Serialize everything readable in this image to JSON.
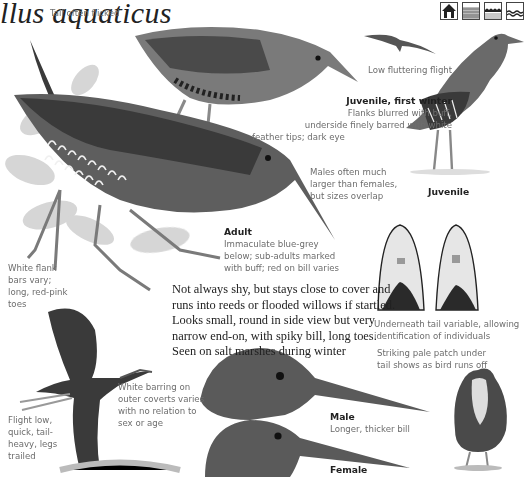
{
  "header": {
    "title": "llus aquaticus",
    "habitat_icons": [
      "reedbed-icon",
      "freshwater-marsh-icon",
      "saltmarsh-icon",
      "coast-water-icon"
    ]
  },
  "captions": {
    "tail": "Tail often flicked",
    "flight_low": "Low fluttering flight",
    "juvenile_first_winter": {
      "heading": "Juvenile, first winter",
      "lines": [
        "Flanks blurred with buff,",
        "underside finely barred with white",
        "feather tips; dark eye"
      ]
    },
    "males_size": [
      "Males often much",
      "larger than females,",
      "but sizes overlap"
    ],
    "juvenile": "Juvenile",
    "adult": {
      "heading": "Adult",
      "lines": [
        "Immaculate blue-grey",
        "below; sub-adults marked",
        "with buff; red on bill varies"
      ]
    },
    "white_flank": [
      "White flank",
      "bars vary;",
      "long, red-pink",
      "toes"
    ],
    "main_text": [
      "Not always shy, but stays close to cover and",
      "runs into reeds or flooded willows if startled.",
      "Looks small, round in side view but very",
      "narrow end-on, with spiky bill, long toes.",
      "Seen on salt marshes during winter"
    ],
    "undertail": [
      "Underneath tail variable, allowing",
      "identification of individuals"
    ],
    "pale_patch": [
      "Striking pale patch under",
      "tail shows as bird runs off"
    ],
    "white_barring": [
      "White barring on",
      "outer coverts varies",
      "with no relation to",
      "sex or age"
    ],
    "flight_low_quick": [
      "Flight low,",
      "quick, tail-",
      "heavy, legs",
      "trailed"
    ],
    "male": {
      "heading": "Male",
      "line": "Longer, thicker bill"
    },
    "female": {
      "heading": "Female"
    }
  },
  "colors": {
    "text_dark": "#222222",
    "caption_grey": "#6d6d6d",
    "bird_dark": "#3a3a3a",
    "bird_mid": "#6a6a6a",
    "foliage": "#c9c9c9"
  }
}
